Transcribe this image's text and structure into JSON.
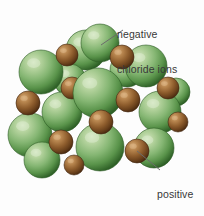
{
  "figure": {
    "name": "sodium-chloride-lattice-diagram",
    "background_color": "#fdfdfd",
    "width": 204,
    "height": 216
  },
  "labels": {
    "chloride": {
      "line1": "negative",
      "line2": "chloride ions",
      "text_color": "#383838"
    },
    "sodium": {
      "line1": "positive",
      "line2": "sodium",
      "line3": "ions",
      "text_color": "#383838"
    }
  },
  "leader_lines": {
    "chloride": {
      "x1": 123,
      "y1": 30,
      "x2": 101,
      "y2": 45,
      "color": "#6b6b6b"
    },
    "sodium": {
      "x1": 137,
      "y1": 151,
      "x2": 160,
      "y2": 170,
      "color": "#6b6b6b"
    }
  },
  "legend_colors": {
    "chloride_ion_light": "#bcd6a8",
    "chloride_ion_mid": "#72a862",
    "chloride_ion_dark": "#2f6127",
    "sodium_ion_light": "#c49a63",
    "sodium_ion_mid": "#8d5c2c",
    "sodium_ion_dark": "#4e3013"
  },
  "chart_data": {
    "type": "scatter",
    "xlabel": "",
    "ylabel": "",
    "species": [
      {
        "name": "negative chloride ions",
        "color": "#72a862",
        "radius_px": 22,
        "count": 14
      },
      {
        "name": "positive sodium ions",
        "color": "#8d5c2c",
        "radius_px": 12,
        "count": 11
      }
    ],
    "ions": [
      {
        "id": "cl-1",
        "species": "chloride",
        "cx": 41,
        "cy": 72,
        "r": 22,
        "z": 2
      },
      {
        "id": "cl-2",
        "species": "chloride",
        "cx": 30,
        "cy": 135,
        "r": 22,
        "z": 2
      },
      {
        "id": "cl-3",
        "species": "chloride",
        "cx": 86,
        "cy": 50,
        "r": 20,
        "z": 1
      },
      {
        "id": "cl-4",
        "species": "chloride",
        "cx": 100,
        "cy": 43,
        "r": 19,
        "z": 1
      },
      {
        "id": "cl-5",
        "species": "chloride",
        "cx": 146,
        "cy": 66,
        "r": 21,
        "z": 2
      },
      {
        "id": "cl-6",
        "species": "chloride",
        "cx": 160,
        "cy": 112,
        "r": 21,
        "z": 2
      },
      {
        "id": "cl-7",
        "species": "chloride",
        "cx": 154,
        "cy": 148,
        "r": 20,
        "z": 3
      },
      {
        "id": "cl-8",
        "species": "chloride",
        "cx": 62,
        "cy": 112,
        "r": 20,
        "z": 3
      },
      {
        "id": "cl-9",
        "species": "chloride",
        "cx": 98,
        "cy": 93,
        "r": 25,
        "z": 4
      },
      {
        "id": "cl-10",
        "species": "chloride",
        "cx": 100,
        "cy": 147,
        "r": 24,
        "z": 5
      },
      {
        "id": "cl-11",
        "species": "chloride",
        "cx": 42,
        "cy": 160,
        "r": 18,
        "z": 4
      },
      {
        "id": "cl-12",
        "species": "chloride",
        "cx": 127,
        "cy": 70,
        "r": 17,
        "z": 1
      },
      {
        "id": "cl-13",
        "species": "chloride",
        "cx": 176,
        "cy": 92,
        "r": 14,
        "z": 1
      },
      {
        "id": "cl-14",
        "species": "chloride",
        "cx": 70,
        "cy": 80,
        "r": 16,
        "z": 1
      },
      {
        "id": "na-1",
        "species": "sodium",
        "cx": 67,
        "cy": 55,
        "r": 11,
        "z": 3
      },
      {
        "id": "na-2",
        "species": "sodium",
        "cx": 122,
        "cy": 57,
        "r": 12,
        "z": 3
      },
      {
        "id": "na-3",
        "species": "sodium",
        "cx": 28,
        "cy": 103,
        "r": 12,
        "z": 4
      },
      {
        "id": "na-4",
        "species": "sodium",
        "cx": 72,
        "cy": 88,
        "r": 11,
        "z": 3
      },
      {
        "id": "na-5",
        "species": "sodium",
        "cx": 128,
        "cy": 100,
        "r": 12,
        "z": 5
      },
      {
        "id": "na-6",
        "species": "sodium",
        "cx": 168,
        "cy": 88,
        "r": 11,
        "z": 3
      },
      {
        "id": "na-7",
        "species": "sodium",
        "cx": 61,
        "cy": 142,
        "r": 12,
        "z": 6
      },
      {
        "id": "na-8",
        "species": "sodium",
        "cx": 101,
        "cy": 122,
        "r": 12,
        "z": 6
      },
      {
        "id": "na-9",
        "species": "sodium",
        "cx": 137,
        "cy": 151,
        "r": 12,
        "z": 6
      },
      {
        "id": "na-10",
        "species": "sodium",
        "cx": 74,
        "cy": 165,
        "r": 10,
        "z": 5
      },
      {
        "id": "na-11",
        "species": "sodium",
        "cx": 178,
        "cy": 122,
        "r": 10,
        "z": 3
      }
    ],
    "annotations": [
      {
        "text": "negative chloride ions",
        "points_to": "cl-4"
      },
      {
        "text": "positive sodium ions",
        "points_to": "na-9"
      }
    ]
  }
}
